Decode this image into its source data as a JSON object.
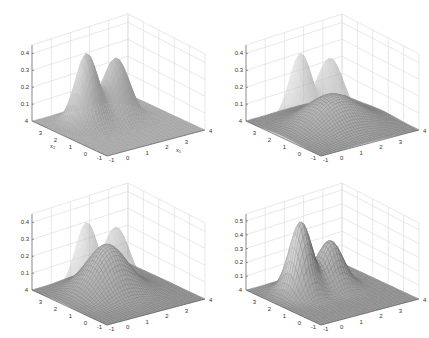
{
  "figure": {
    "layout": "2x2 grid of 3D surface plots",
    "colormap": "gray",
    "background": "#ffffff"
  },
  "chart_data": [
    {
      "type": "surface",
      "panel": "top-left",
      "title": "",
      "xlabel": "x1",
      "ylabel": "x2",
      "zlabel": "",
      "x_ticks": [
        "-1",
        "0",
        "1",
        "2",
        "3",
        "4"
      ],
      "y_ticks": [
        "-1",
        "0",
        "1",
        "2",
        "3",
        "4"
      ],
      "z_ticks": [
        "0.1",
        "0.2",
        "0.3",
        "0.4"
      ],
      "xlim": [
        -1,
        4
      ],
      "ylim": [
        -1,
        4
      ],
      "zlim": [
        0,
        0.45
      ],
      "grid": true,
      "surfaces": [
        {
          "name": "target density (bimodal)",
          "style": "smooth shaded",
          "peaks": [
            {
              "x1": 0.5,
              "x2": 2.5,
              "z": 0.42
            },
            {
              "x1": 2.0,
              "x2": 2.5,
              "z": 0.35
            }
          ],
          "saddle_z": 0.24
        }
      ]
    },
    {
      "type": "surface",
      "panel": "top-right",
      "title": "",
      "xlabel": "",
      "ylabel": "",
      "zlabel": "",
      "x_ticks": [
        "-1",
        "0",
        "1",
        "2",
        "3",
        "4"
      ],
      "y_ticks": [
        "-1",
        "0",
        "1",
        "2",
        "3",
        "4"
      ],
      "z_ticks": [
        "0.1",
        "0.2",
        "0.3",
        "0.4"
      ],
      "xlim": [
        -1,
        4
      ],
      "ylim": [
        -1,
        4
      ],
      "zlim": [
        0,
        0.45
      ],
      "grid": true,
      "surfaces": [
        {
          "name": "target density (bimodal)",
          "style": "transparent shaded",
          "peaks": [
            {
              "x1": 0.5,
              "x2": 2.5,
              "z": 0.42
            },
            {
              "x1": 2.0,
              "x2": 2.5,
              "z": 0.35
            }
          ]
        },
        {
          "name": "approximation (broad unimodal)",
          "style": "mesh",
          "peak": {
            "x1": 1.5,
            "x2": 1.5,
            "z": 0.18
          }
        }
      ]
    },
    {
      "type": "surface",
      "panel": "bottom-left",
      "title": "",
      "xlabel": "",
      "ylabel": "",
      "zlabel": "",
      "x_ticks": [
        "-1",
        "0",
        "1",
        "2",
        "3",
        "4"
      ],
      "y_ticks": [
        "-1",
        "0",
        "1",
        "2",
        "3",
        "4"
      ],
      "z_ticks": [
        "0.1",
        "0.2",
        "0.3",
        "0.4"
      ],
      "xlim": [
        -1,
        4
      ],
      "ylim": [
        -1,
        4
      ],
      "zlim": [
        0,
        0.45
      ],
      "grid": true,
      "surfaces": [
        {
          "name": "target density (bimodal)",
          "style": "transparent shaded",
          "peaks": [
            {
              "x1": 0.5,
              "x2": 2.5,
              "z": 0.42
            },
            {
              "x1": 2.0,
              "x2": 2.5,
              "z": 0.35
            }
          ]
        },
        {
          "name": "approximation (unimodal)",
          "style": "mesh",
          "peak": {
            "x1": 1.3,
            "x2": 2.0,
            "z": 0.28
          }
        }
      ]
    },
    {
      "type": "surface",
      "panel": "bottom-right",
      "title": "",
      "xlabel": "",
      "ylabel": "",
      "zlabel": "",
      "x_ticks": [
        "-1",
        "0",
        "1",
        "2",
        "3",
        "4"
      ],
      "y_ticks": [
        "-1",
        "0",
        "1",
        "2",
        "3",
        "4"
      ],
      "z_ticks": [
        "0.1",
        "0.2",
        "0.3",
        "0.4",
        "0.5"
      ],
      "xlim": [
        -1,
        4
      ],
      "ylim": [
        -1,
        4
      ],
      "zlim": [
        0,
        0.55
      ],
      "grid": true,
      "surfaces": [
        {
          "name": "approximation (bimodal mesh)",
          "style": "mesh shaded",
          "peaks": [
            {
              "x1": 0.5,
              "x2": 2.5,
              "z": 0.52
            },
            {
              "x1": 2.0,
              "x2": 2.5,
              "z": 0.33
            }
          ],
          "saddle_z": 0.22
        }
      ]
    }
  ],
  "labels": {
    "x1": "x₁",
    "x2": "x₂",
    "floor_corner_left": "4",
    "floor_corner_right": "4",
    "floor_corner_front_y": "-1",
    "floor_corner_front_x": "-1",
    "panels": [
      {
        "z": [
          "0.1",
          "0.2",
          "0.3",
          "0.4"
        ],
        "y": [
          "3",
          "2",
          "1",
          "0"
        ],
        "x": [
          "0",
          "1",
          "2",
          "3"
        ]
      },
      {
        "z": [
          "0.1",
          "0.2",
          "0.3",
          "0.4"
        ],
        "y": [
          "3",
          "2",
          "1",
          "0"
        ],
        "x": [
          "0",
          "1",
          "2",
          "3"
        ]
      },
      {
        "z": [
          "0.1",
          "0.2",
          "0.3",
          "0.4"
        ],
        "y": [
          "3",
          "2",
          "1",
          "0"
        ],
        "x": [
          "0",
          "1",
          "2",
          "3"
        ]
      },
      {
        "z": [
          "0.1",
          "0.2",
          "0.3",
          "0.4",
          "0.5"
        ],
        "y": [
          "3",
          "2",
          "1",
          "0"
        ],
        "x": [
          "0",
          "1",
          "2",
          "3"
        ]
      }
    ]
  }
}
